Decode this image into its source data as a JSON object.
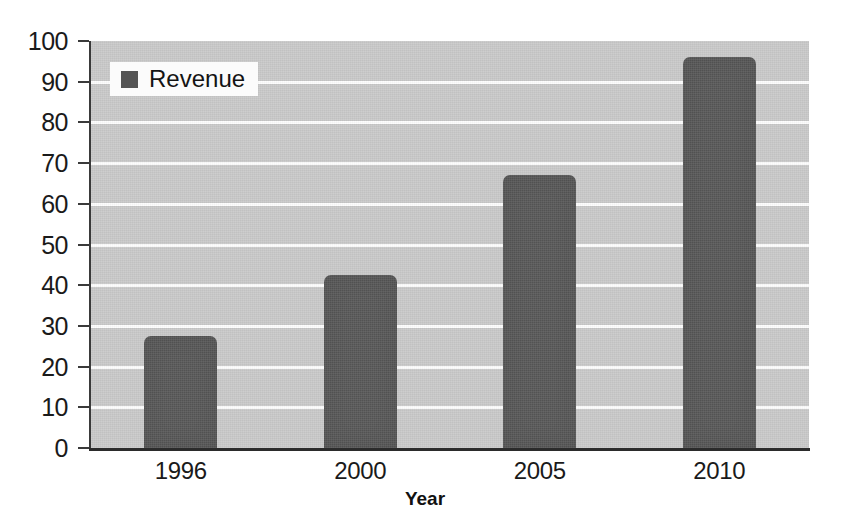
{
  "chart_data": {
    "type": "bar",
    "title": "",
    "subtitle": "",
    "xlabel": "Year",
    "ylabel": "",
    "categories": [
      "1996",
      "2000",
      "2005",
      "2010"
    ],
    "series": [
      {
        "name": "Revenue",
        "values": [
          27.5,
          42.5,
          67,
          96
        ],
        "color": "#575757"
      }
    ],
    "ylim": [
      0,
      100
    ],
    "ytick_step": 10,
    "yticks": [
      0,
      10,
      20,
      30,
      40,
      50,
      60,
      70,
      80,
      90,
      100
    ],
    "ytick_labels": [
      "0",
      "10",
      "20",
      "30",
      "40",
      "50",
      "60",
      "70",
      "80",
      "90",
      "100"
    ],
    "grid": true,
    "gridline_color": "#fdfdfd",
    "plot_background": "#c9c9c9",
    "legend": {
      "position": "top-left-inside",
      "entries": [
        {
          "label": "Revenue",
          "swatch_color": "#555555"
        }
      ]
    },
    "axis_color": "#2b2b2b"
  },
  "legend": {
    "revenue_label": "Revenue"
  },
  "axes": {
    "x_title": "Year"
  }
}
